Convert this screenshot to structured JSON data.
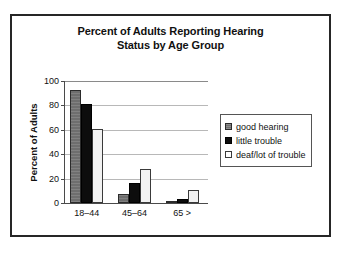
{
  "chart_data": {
    "type": "bar",
    "title": "Percent of Adults Reporting Hearing Status by Age Group",
    "title_lines": [
      "Percent of Adults Reporting Hearing",
      "Status by Age Group"
    ],
    "xlabel": "",
    "ylabel": "Percent of Adults",
    "categories": [
      "18–44",
      "45–64",
      "65 >"
    ],
    "series": [
      {
        "name": "good hearing",
        "values": [
          93,
          7,
          1
        ],
        "color": "#6e6e6e"
      },
      {
        "name": "little trouble",
        "values": [
          81,
          16,
          3
        ],
        "color": "#0d0d0d"
      },
      {
        "name": "deaf/lot of trouble",
        "values": [
          61,
          28,
          11
        ],
        "color": "#f2f2f2"
      }
    ],
    "ylim": [
      0,
      100
    ],
    "yticks": [
      0,
      20,
      40,
      60,
      80,
      100
    ],
    "ytick_labels": [
      "0",
      "20",
      "40",
      "60",
      "80",
      "100"
    ],
    "grid": true,
    "legend_position": "right"
  },
  "legend": {
    "items": [
      {
        "label": "good hearing",
        "swatch": "series-good"
      },
      {
        "label": "little trouble",
        "swatch": "series-little"
      },
      {
        "label": "deaf/lot of trouble",
        "swatch": "series-deaf"
      }
    ]
  },
  "colors": {
    "frame": "#262626",
    "axis": "#4a4a4a",
    "gridline": "#b8b8b8",
    "text": "#111111",
    "background": "#ffffff"
  }
}
